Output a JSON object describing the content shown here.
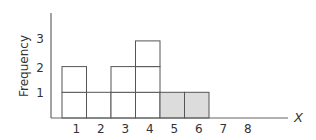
{
  "chart_data": {
    "type": "bar",
    "subtype": "histogram (stacked unit boxes)",
    "title": "",
    "xlabel": "X",
    "ylabel": "Frequency",
    "categories": [
      "1",
      "2",
      "3",
      "4",
      "5",
      "6",
      "7",
      "8"
    ],
    "values": [
      2,
      1,
      2,
      3,
      1,
      1,
      0,
      0
    ],
    "highlighted": [
      false,
      false,
      false,
      false,
      true,
      true,
      false,
      false
    ],
    "yticks": [
      "1",
      "2",
      "3"
    ],
    "ylim": [
      0,
      4
    ],
    "grid": false,
    "legend": null
  },
  "style": {
    "axis_color": "#666666",
    "bar_edge_color": "#555555",
    "bar_fill": "#ffffff",
    "highlight_fill": "#dcdcdc"
  }
}
